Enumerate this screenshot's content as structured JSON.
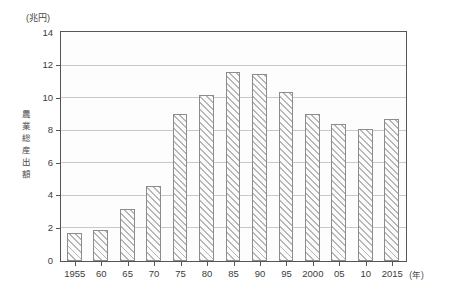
{
  "chart_data": {
    "type": "bar",
    "title": "",
    "subtitle": "",
    "unit_label": "(兆円)",
    "ylabel": "農業総産出額",
    "ylabel_chars": [
      "農",
      "業",
      "総",
      "産",
      "出",
      "額"
    ],
    "xlabel": "(年)",
    "categories": [
      "1955",
      "60",
      "65",
      "70",
      "75",
      "80",
      "85",
      "90",
      "95",
      "2000",
      "05",
      "10",
      "2015"
    ],
    "values": [
      1.7,
      1.9,
      3.2,
      4.6,
      9.0,
      10.2,
      11.6,
      11.5,
      10.4,
      9.0,
      8.4,
      8.1,
      8.7
    ],
    "ylim": [
      0,
      14
    ],
    "yticks": [
      0,
      2,
      4,
      6,
      8,
      10,
      12,
      14
    ],
    "ytick_labels": [
      "0",
      "2",
      "4",
      "6",
      "8",
      "10",
      "12",
      "14"
    ],
    "grid": true,
    "grid_axis": "y",
    "legend": false,
    "legend_position": "none",
    "bar_fill": "#fbfbfb",
    "bar_hatch": "diagonal-forward-slash",
    "bar_hatch_color": "#b6b6b6",
    "bar_border": "#8c8c8c",
    "frame_color": "#555555",
    "gridline_color": "#c9c9c9",
    "plot_background": "#fdfdfd",
    "page_background": "#ffffff"
  }
}
